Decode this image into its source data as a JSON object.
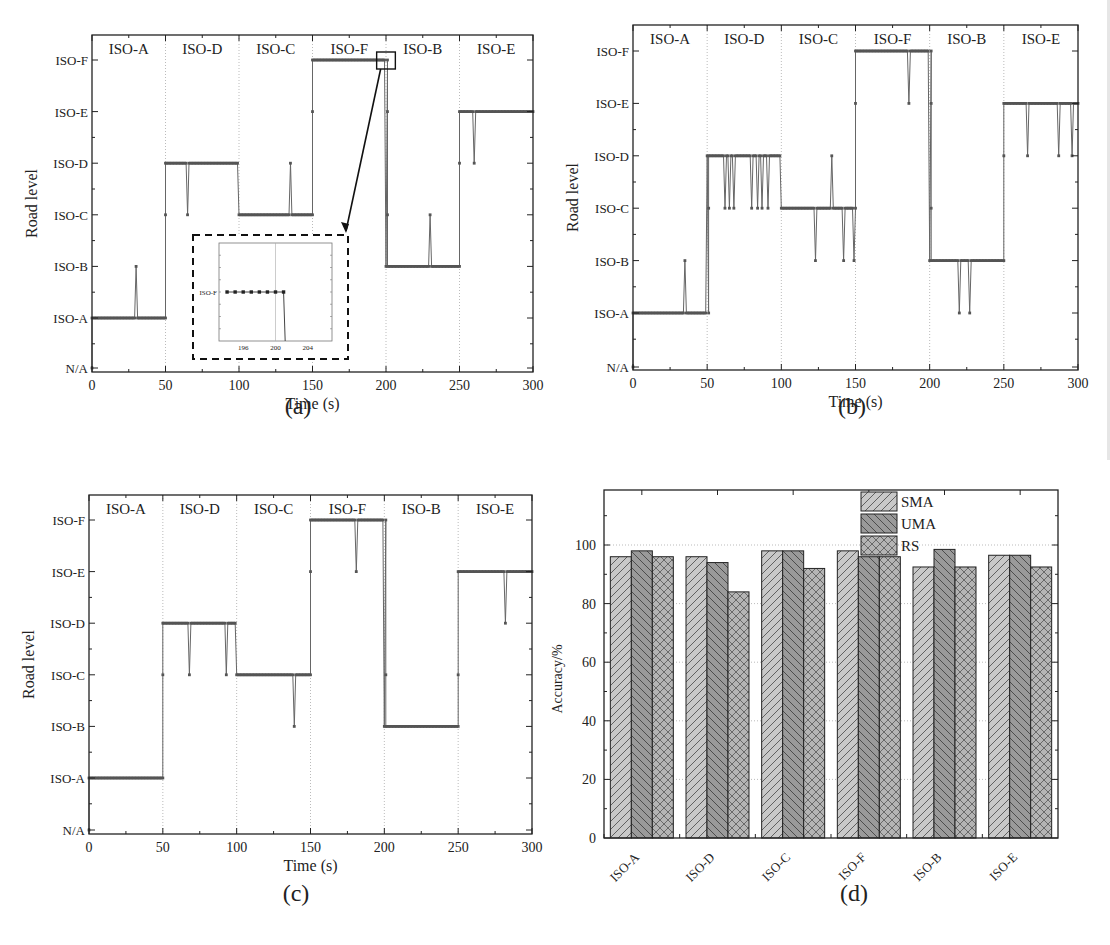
{
  "figure": {
    "captions": [
      "(a)",
      "(b)",
      "(c)",
      "(d)"
    ]
  },
  "chart_data": [
    {
      "id": "a",
      "type": "line",
      "caption": "(a)",
      "xlabel": "Time (s)",
      "ylabel": "Road level",
      "xlim": [
        0,
        300
      ],
      "xticks": [
        0,
        50,
        100,
        150,
        200,
        250,
        300
      ],
      "ytick_labels": [
        "N/A",
        "ISO-A",
        "ISO-B",
        "ISO-C",
        "ISO-D",
        "ISO-E",
        "ISO-F"
      ],
      "segments": [
        {
          "label": "ISO-A",
          "start": 0,
          "end": 50,
          "level": 1
        },
        {
          "label": "ISO-D",
          "start": 50,
          "end": 100,
          "level": 4
        },
        {
          "label": "ISO-C",
          "start": 100,
          "end": 150,
          "level": 3
        },
        {
          "label": "ISO-F",
          "start": 150,
          "end": 200,
          "level": 6
        },
        {
          "label": "ISO-B",
          "start": 200,
          "end": 250,
          "level": 2
        },
        {
          "label": "ISO-E",
          "start": 250,
          "end": 300,
          "level": 5
        }
      ],
      "anomalies": [
        {
          "t": 30,
          "level": 2
        },
        {
          "t": 65,
          "level": 3
        },
        {
          "t": 135,
          "level": 4
        },
        {
          "t": 230,
          "level": 3
        },
        {
          "t": 260,
          "level": 4
        }
      ],
      "transitions": [
        {
          "t": 0,
          "levels": [
            0,
            1
          ]
        },
        {
          "t": 50,
          "levels": [
            1,
            3,
            4
          ]
        },
        {
          "t": 150,
          "levels": [
            3,
            5,
            6
          ]
        },
        {
          "t": 201,
          "levels": [
            6,
            5,
            3,
            2
          ]
        },
        {
          "t": 250,
          "levels": [
            2,
            4,
            5
          ]
        }
      ],
      "grid": "vertical dotted at segment boundaries",
      "inset": {
        "xticks": [
          196,
          200,
          204
        ],
        "xlim": [
          193,
          207
        ],
        "ytick_label": "ISO-F",
        "points_t": [
          194,
          195,
          196,
          197,
          198,
          199,
          200,
          201
        ],
        "drop_at": 201.2,
        "zoom_box_t": [
          195,
          205
        ]
      }
    },
    {
      "id": "b",
      "type": "line",
      "caption": "(b)",
      "xlabel": "Time (s)",
      "ylabel": "Road level",
      "xlim": [
        0,
        300
      ],
      "xticks": [
        0,
        50,
        100,
        150,
        200,
        250,
        300
      ],
      "ytick_labels": [
        "N/A",
        "ISO-A",
        "ISO-B",
        "ISO-C",
        "ISO-D",
        "ISO-E",
        "ISO-F"
      ],
      "segments": [
        {
          "label": "ISO-A",
          "start": 0,
          "end": 50,
          "level": 1
        },
        {
          "label": "ISO-D",
          "start": 50,
          "end": 100,
          "level": 4
        },
        {
          "label": "ISO-C",
          "start": 100,
          "end": 150,
          "level": 3
        },
        {
          "label": "ISO-F",
          "start": 150,
          "end": 200,
          "level": 6
        },
        {
          "label": "ISO-B",
          "start": 200,
          "end": 250,
          "level": 2
        },
        {
          "label": "ISO-E",
          "start": 250,
          "end": 300,
          "level": 5
        }
      ],
      "anomalies": [
        {
          "t": 35,
          "level": 2
        },
        {
          "t": 62,
          "level": 3
        },
        {
          "t": 65,
          "level": 3
        },
        {
          "t": 68,
          "level": 3
        },
        {
          "t": 80,
          "level": 3
        },
        {
          "t": 84,
          "level": 3
        },
        {
          "t": 87,
          "level": 3
        },
        {
          "t": 91,
          "level": 3
        },
        {
          "t": 123,
          "level": 2
        },
        {
          "t": 134,
          "level": 4
        },
        {
          "t": 142,
          "level": 2
        },
        {
          "t": 149,
          "level": 2
        },
        {
          "t": 186,
          "level": 5
        },
        {
          "t": 220,
          "level": 1
        },
        {
          "t": 227,
          "level": 1
        },
        {
          "t": 266,
          "level": 4
        },
        {
          "t": 287,
          "level": 4
        },
        {
          "t": 296,
          "level": 4
        }
      ],
      "transitions": [
        {
          "t": 0,
          "levels": [
            0,
            1
          ]
        },
        {
          "t": 51,
          "levels": [
            1,
            3,
            4
          ]
        },
        {
          "t": 150,
          "levels": [
            3,
            5,
            6
          ]
        },
        {
          "t": 201,
          "levels": [
            6,
            5,
            3,
            2
          ]
        },
        {
          "t": 250,
          "levels": [
            2,
            4,
            5
          ]
        }
      ],
      "grid": "vertical dotted at segment boundaries"
    },
    {
      "id": "c",
      "type": "line",
      "caption": "(c)",
      "xlabel": "Time (s)",
      "ylabel": "Road level",
      "xlim": [
        0,
        300
      ],
      "xticks": [
        0,
        50,
        100,
        150,
        200,
        250,
        300
      ],
      "ytick_labels": [
        "N/A",
        "ISO-A",
        "ISO-B",
        "ISO-C",
        "ISO-D",
        "ISO-E",
        "ISO-F"
      ],
      "segments": [
        {
          "label": "ISO-A",
          "start": 0,
          "end": 50,
          "level": 1
        },
        {
          "label": "ISO-D",
          "start": 50,
          "end": 100,
          "level": 4
        },
        {
          "label": "ISO-C",
          "start": 100,
          "end": 150,
          "level": 3
        },
        {
          "label": "ISO-F",
          "start": 150,
          "end": 200,
          "level": 6
        },
        {
          "label": "ISO-B",
          "start": 200,
          "end": 250,
          "level": 2
        },
        {
          "label": "ISO-E",
          "start": 250,
          "end": 300,
          "level": 5
        }
      ],
      "anomalies": [
        {
          "t": 68,
          "level": 3
        },
        {
          "t": 93,
          "level": 3
        },
        {
          "t": 139,
          "level": 2
        },
        {
          "t": 181,
          "level": 5
        },
        {
          "t": 282,
          "level": 4
        }
      ],
      "transitions": [
        {
          "t": 0,
          "levels": [
            0,
            1
          ]
        },
        {
          "t": 50,
          "levels": [
            1,
            3,
            4
          ]
        },
        {
          "t": 150,
          "levels": [
            3,
            5,
            6
          ]
        },
        {
          "t": 201,
          "levels": [
            6,
            3,
            2
          ]
        },
        {
          "t": 250,
          "levels": [
            2,
            3,
            5
          ]
        }
      ],
      "grid": "vertical dotted at segment boundaries"
    },
    {
      "id": "d",
      "type": "bar",
      "caption": "(d)",
      "xlabel": "",
      "ylabel": "Accuracy/%",
      "ylim": [
        0,
        118
      ],
      "yticks": [
        0,
        20,
        40,
        60,
        80,
        100
      ],
      "categories": [
        "ISO-A",
        "ISO-D",
        "ISO-C",
        "ISO-F",
        "ISO-B",
        "ISO-E"
      ],
      "series": [
        {
          "name": "SMA",
          "pattern": "forward-hatch",
          "fill": "#c8c8c8",
          "values": [
            96,
            96,
            98,
            98,
            92.5,
            96.5
          ]
        },
        {
          "name": "UMA",
          "pattern": "back-hatch",
          "fill": "#9a9a9a",
          "values": [
            98,
            94,
            98,
            96,
            98.5,
            96.5
          ]
        },
        {
          "name": "RS",
          "pattern": "crosshatch",
          "fill": "#b4b4b4",
          "values": [
            96,
            84,
            92,
            96,
            92.5,
            92.5
          ]
        }
      ],
      "grid": "horizontal dotted at 20,40,60,80,100",
      "legend_position": "top-center inside plot"
    }
  ]
}
